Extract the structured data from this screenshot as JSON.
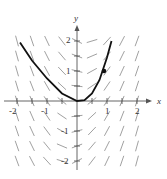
{
  "chart_data": {
    "type": "line",
    "title": "",
    "xlabel": "x",
    "ylabel": "y",
    "xlim": [
      -2.2,
      2.3
    ],
    "ylim": [
      -2.3,
      2.5
    ],
    "x_tick_labels": [
      "-2",
      "-1",
      "1",
      "2"
    ],
    "y_tick_labels": [
      "2",
      "1",
      "-1",
      "-2"
    ],
    "grid": false,
    "slope_field": {
      "description": "direction field segments on a half-unit lattice",
      "x_values": [
        -2,
        -1.5,
        -1,
        -0.5,
        0.5,
        1,
        1.5,
        2
      ],
      "y_values": [
        -2,
        -1.5,
        -1,
        -0.5,
        0.5,
        1,
        1.5,
        2
      ]
    },
    "series": [
      {
        "name": "solution curve",
        "x": [
          -1.9,
          -1.5,
          -1.0,
          -0.5,
          0.0,
          0.25,
          0.5,
          0.75,
          1.0,
          1.15
        ],
        "y": [
          1.95,
          1.35,
          0.75,
          0.25,
          0.0,
          0.03,
          0.25,
          0.7,
          1.45,
          2.0
        ]
      }
    ],
    "annotations": [
      {
        "type": "point",
        "x": 0.9,
        "y": 1.0,
        "label": ""
      }
    ]
  }
}
